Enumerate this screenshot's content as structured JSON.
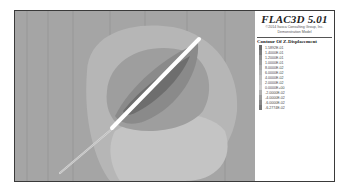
{
  "header": {
    "app_title": "FLAC3D 5.01",
    "copyright": "©2014 Itasca Consulting Group, Inc.",
    "model_label": "Demonstration Model"
  },
  "legend": {
    "title": "Contour Of Z-Displacement",
    "items": [
      {
        "label": "1.5892E-01",
        "color": "#6a6a6a"
      },
      {
        "label": "1.4000E-01",
        "color": "#7c7c7c"
      },
      {
        "label": "1.2000E-01",
        "color": "#8e8e8e"
      },
      {
        "label": "1.0000E-01",
        "color": "#9c9c9c"
      },
      {
        "label": "8.0000E-02",
        "color": "#a9a9a9"
      },
      {
        "label": "6.0000E-02",
        "color": "#b4b4b4"
      },
      {
        "label": "4.0000E-02",
        "color": "#bdbdbd"
      },
      {
        "label": "2.0000E-02",
        "color": "#c6c6c6"
      },
      {
        "label": "0.0000E+00",
        "color": "#cdcdcd"
      },
      {
        "label": "-2.0000E-02",
        "color": "#b0b0b0"
      },
      {
        "label": "-4.0000E-02",
        "color": "#9a9a9a"
      },
      {
        "label": "-6.0000E-02",
        "color": "#878787"
      },
      {
        "label": "-6.2774E-02",
        "color": "#767676"
      }
    ]
  },
  "plot": {
    "background_color": "#a6a6a6",
    "fault_color": "#ffffff"
  }
}
